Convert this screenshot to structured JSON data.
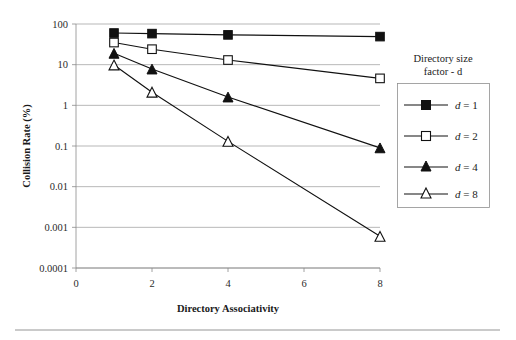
{
  "chart_data": {
    "type": "line",
    "title": "",
    "xlabel": "Directory Associativity",
    "ylabel": "Collision Rate (%)",
    "x": [
      1,
      2,
      4,
      8
    ],
    "xlim": [
      0,
      8
    ],
    "xticks": [
      "0",
      "2",
      "4",
      "6",
      "8"
    ],
    "xtick_values": [
      0,
      2,
      4,
      6,
      8
    ],
    "ylim": [
      0.0001,
      100
    ],
    "yscale": "log",
    "yticks": [
      "100",
      "10",
      "1",
      "0.1",
      "0.01",
      "0.001",
      "0.0001"
    ],
    "ytick_values": [
      100,
      10,
      1,
      0.1,
      0.01,
      0.001,
      0.0001
    ],
    "grid": "horizontal-major",
    "legend_position": "right",
    "legend_title_line1": "Directory size",
    "legend_title_line2": "factor - d",
    "series": [
      {
        "name": "d = 1",
        "label_prefix": "d",
        "label_suffix": " = 1",
        "marker": "filled-square",
        "color": "#111111",
        "values": [
          60,
          58,
          54,
          49
        ]
      },
      {
        "name": "d = 2",
        "label_prefix": "d",
        "label_suffix": " = 2",
        "marker": "open-square",
        "color": "#111111",
        "values": [
          35,
          24,
          13,
          4.6
        ]
      },
      {
        "name": "d = 4",
        "label_prefix": "d",
        "label_suffix": " = 4",
        "marker": "filled-triangle",
        "color": "#111111",
        "values": [
          19,
          7.8,
          1.6,
          0.09
        ]
      },
      {
        "name": "d = 8",
        "label_prefix": "d",
        "label_suffix": " = 8",
        "marker": "open-triangle",
        "color": "#111111",
        "values": [
          9.8,
          2.1,
          0.13,
          0.0006
        ]
      }
    ]
  },
  "axes": {
    "ylabel": "Collision Rate (%)",
    "xlabel": "Directory Associativity"
  },
  "legend": {
    "title_line1": "Directory size",
    "title_line2": "factor - d",
    "entries": [
      {
        "label": "d = 1",
        "d_italic": "d",
        "rest": " = 1",
        "marker": "filled-square"
      },
      {
        "label": "d = 2",
        "d_italic": "d",
        "rest": " = 2",
        "marker": "open-square"
      },
      {
        "label": "d = 4",
        "d_italic": "d",
        "rest": " = 4",
        "marker": "filled-triangle"
      },
      {
        "label": "d = 8",
        "d_italic": "d",
        "rest": " = 8",
        "marker": "open-triangle"
      }
    ]
  },
  "colors": {
    "ink": "#111111",
    "grid": "#9a9a9a",
    "rule": "#b8b8b8",
    "background": "#ffffff"
  }
}
